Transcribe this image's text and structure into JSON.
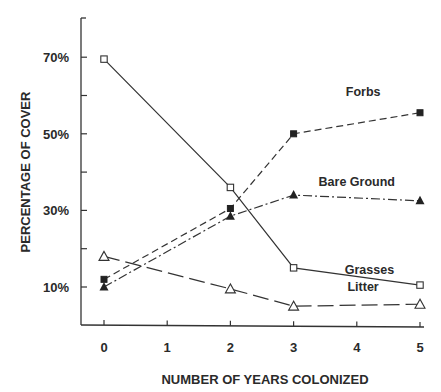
{
  "chart_data": {
    "type": "line",
    "title": "",
    "xlabel": "NUMBER OF YEARS COLONIZED",
    "ylabel": "PERCENTAGE OF COVER",
    "x_ticks": [
      0,
      1,
      2,
      3,
      4,
      5
    ],
    "x_tick_labels": [
      "0",
      "1",
      "2",
      "3",
      "4",
      "5"
    ],
    "y_tick_labels": [
      "70%",
      "50%",
      "30%",
      "10%"
    ],
    "y_tick_values": [
      70,
      50,
      30,
      10
    ],
    "xlim": [
      -0.5,
      5
    ],
    "ylim": [
      0,
      80
    ],
    "grid": false,
    "legend_position": "inline labels",
    "series": [
      {
        "name": "Grasses",
        "marker": "open-square",
        "line": "solid",
        "x": [
          0,
          2,
          3,
          5
        ],
        "values": [
          69.5,
          36,
          15,
          10.5
        ],
        "label_pos": {
          "x": 4.2,
          "y": 13.5
        }
      },
      {
        "name": "Forbs",
        "marker": "filled-square",
        "line": "dashed",
        "x": [
          0,
          2,
          3,
          5
        ],
        "values": [
          12,
          30.5,
          50,
          55.5
        ],
        "label_pos": {
          "x": 4.1,
          "y": 60
        }
      },
      {
        "name": "Bare Ground",
        "marker": "filled-triangle",
        "line": "dash-dot",
        "x": [
          0,
          2,
          3,
          5
        ],
        "values": [
          10,
          28.5,
          34,
          32.5
        ],
        "label_pos": {
          "x": 4.0,
          "y": 36.5
        }
      },
      {
        "name": "Litter",
        "marker": "open-triangle",
        "line": "long-dash",
        "x": [
          0,
          2,
          3,
          5
        ],
        "values": [
          18,
          9.5,
          5,
          5.5
        ],
        "label_pos": {
          "x": 4.1,
          "y": 9
        }
      }
    ]
  }
}
